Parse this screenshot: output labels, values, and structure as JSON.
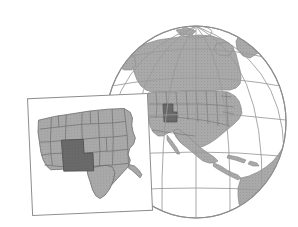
{
  "figure": {
    "name": "globe-with-us-inset-locator-map",
    "background_color": "#ffffff",
    "width": 298,
    "height": 227
  },
  "globe": {
    "name": "globe",
    "center_x": 196,
    "center_y": 122,
    "radius_x": 90,
    "radius_y": 96,
    "outline_color": "#8d8d8d",
    "graticule_color": "#9a9a9a",
    "ocean_color": "#ffffff",
    "land_color": "#a9a9a9",
    "land_outline_color": "#8a8a8a",
    "state_border_color": "#6e6e6e",
    "highlight_color": "#6a6a6a",
    "meridian_count": 7,
    "parallel_count": 5,
    "landmasses": [
      "North America",
      "Canada",
      "Greenland",
      "United States",
      "Mexico",
      "Central America",
      "Caribbean islands",
      "northern South America"
    ],
    "highlighted_region": "Utah"
  },
  "inset": {
    "name": "inset-panel",
    "rotation_deg": -2.5,
    "x": 30,
    "y": 96,
    "width": 120,
    "height": 117,
    "fill": "#ffffff",
    "border_color": "#8d8d8d",
    "border_width": 1,
    "land_color": "#a9a9a9",
    "land_outline_color": "#6e6e6e",
    "state_border_color": "#6e6e6e",
    "highlight_color": "#6a6a6a",
    "highlighted_region": "Utah",
    "region_shown": "Western and Central United States"
  },
  "colors": {
    "land": "#a9a9a9",
    "land_dark_highlight": "#6a6a6a",
    "outline": "#8d8d8d",
    "graticule": "#9a9a9a",
    "state_border": "#6e6e6e",
    "background": "#ffffff"
  }
}
